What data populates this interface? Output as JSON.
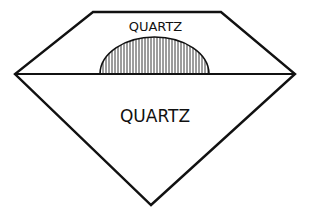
{
  "diagram": {
    "labels": {
      "crown": "QUARTZ",
      "pavilion": "QUARTZ"
    },
    "colors": {
      "stroke": "#111111",
      "background": "#ffffff",
      "hatch": "#222222"
    },
    "shapes": {
      "outline": "octagonal gem outline (table at top, girdle at middle, culet at bottom)",
      "girdle_line": "horizontal line across widest point",
      "dome": "vertically hatched semicircle resting on girdle line"
    }
  }
}
